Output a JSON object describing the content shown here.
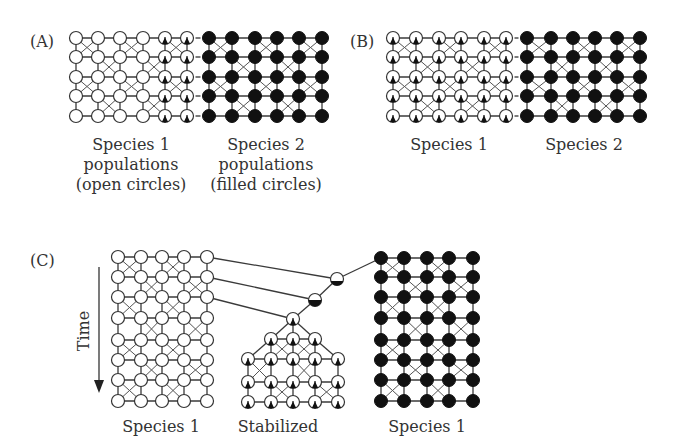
{
  "figure": {
    "panels": [
      {
        "id": "A",
        "label": "(A)",
        "grids": [
          {
            "name": "species-1-grid",
            "style": "open",
            "cols": [
              76,
              98,
              120,
              143,
              165,
              187
            ],
            "rows": [
              38,
              57,
              77,
              96,
              116
            ],
            "triangle_cols": [
              4,
              5
            ]
          },
          {
            "name": "species-2-grid",
            "style": "filled",
            "cols": [
              209,
              232,
              255,
              277,
              299,
              322
            ],
            "rows": [
              38,
              57,
              77,
              96,
              116
            ]
          }
        ],
        "captions": [
          {
            "lines": [
              "Species 1",
              "populations",
              "(open circles)"
            ],
            "x": 131
          },
          {
            "lines": [
              "Species 2",
              "populations",
              "(filled circles)"
            ],
            "x": 266
          }
        ]
      },
      {
        "id": "B",
        "label": "(B)",
        "grids": [
          {
            "name": "species-1-grid",
            "style": "open",
            "cols": [
              393,
              416,
              439,
              461,
              484,
              506
            ],
            "rows": [
              38,
              57,
              77,
              96,
              116
            ],
            "triangle_cols": [
              0,
              1,
              2,
              3,
              4,
              5
            ]
          },
          {
            "name": "species-2-grid",
            "style": "filled",
            "cols": [
              527,
              551,
              573,
              595,
              617,
              640
            ],
            "rows": [
              38,
              57,
              77,
              96,
              116
            ]
          }
        ],
        "captions": [
          {
            "lines": [
              "Species 1"
            ],
            "x": 449
          },
          {
            "lines": [
              "Species 2"
            ],
            "x": 584
          }
        ]
      },
      {
        "id": "C",
        "label": "(C)",
        "time_label": "Time",
        "grids": [
          {
            "name": "species-1-grid",
            "style": "open",
            "cols": [
              118,
              141,
              162,
              184,
              207
            ],
            "rows": [
              257,
              277,
              297,
              318,
              340,
              360,
              380,
              401
            ],
            "triangle_cols": []
          },
          {
            "name": "species-1-filled-grid",
            "style": "filled",
            "cols": [
              381,
              404,
              427,
              449,
              473
            ],
            "rows": [
              258,
              277,
              297,
              318,
              340,
              360,
              380,
              401
            ]
          }
        ],
        "hybrids": [
          {
            "name": "hybrid-node-1",
            "x": 337,
            "y": 279,
            "fill_fraction": 0.35
          },
          {
            "name": "hybrid-node-2",
            "x": 315,
            "y": 300,
            "fill_fraction": 0.5
          }
        ],
        "stabilized": {
          "apex": {
            "x": 293,
            "y": 319
          },
          "row3": {
            "cols": [
              271,
              293,
              315
            ],
            "y": 339
          },
          "rows5": {
            "cols": [
              248,
              271,
              293,
              315,
              338
            ],
            "ys": [
              359,
              382,
              402
            ]
          }
        },
        "captions": [
          {
            "lines": [
              "Species 1"
            ],
            "x": 161
          },
          {
            "lines": [
              "Stabilized"
            ],
            "x": 278
          },
          {
            "lines": [
              "Species 1"
            ],
            "x": 427
          }
        ]
      }
    ]
  }
}
